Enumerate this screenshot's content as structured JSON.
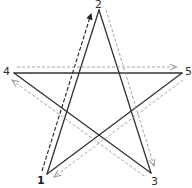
{
  "diagram": {
    "type": "pentagram-stroke-order",
    "vertices": [
      {
        "id": "1",
        "label": "1",
        "x": 47,
        "y": 174,
        "label_x": 37,
        "label_y": 175,
        "bold": true
      },
      {
        "id": "2",
        "label": "2",
        "x": 99,
        "y": 10,
        "label_x": 95,
        "label_y": -1,
        "bold": false
      },
      {
        "id": "3",
        "label": "3",
        "x": 151,
        "y": 173,
        "label_x": 151,
        "label_y": 176,
        "bold": false
      },
      {
        "id": "4",
        "label": "4",
        "x": 14,
        "y": 73,
        "label_x": 3,
        "label_y": 66,
        "bold": false
      },
      {
        "id": "5",
        "label": "5",
        "x": 182,
        "y": 73,
        "label_x": 185,
        "label_y": 66,
        "bold": false
      }
    ],
    "edges": [
      {
        "from": "1",
        "to": "2"
      },
      {
        "from": "2",
        "to": "3"
      },
      {
        "from": "3",
        "to": "4"
      },
      {
        "from": "4",
        "to": "5"
      },
      {
        "from": "5",
        "to": "1"
      }
    ],
    "arrows": [
      {
        "from": "1",
        "to": "2",
        "x1": 42,
        "y1": 171,
        "x2": 91,
        "y2": 14,
        "style": "dashed",
        "color": "#222222"
      },
      {
        "from": "2",
        "to": "3",
        "x1": 106,
        "y1": 10,
        "x2": 154,
        "y2": 166,
        "style": "dashed",
        "color": "#999999"
      },
      {
        "from": "3",
        "to": "4",
        "x1": 144,
        "y1": 176,
        "x2": 12,
        "y2": 80,
        "style": "dashed",
        "color": "#999999"
      },
      {
        "from": "4",
        "to": "5",
        "x1": 17,
        "y1": 67,
        "x2": 177,
        "y2": 67,
        "style": "dashed",
        "color": "#999999"
      },
      {
        "from": "5",
        "to": "1",
        "x1": 183,
        "y1": 80,
        "x2": 54,
        "y2": 177,
        "style": "dashed",
        "color": "#999999"
      }
    ],
    "colors": {
      "star_line": "#333333",
      "first_arrow": "#222222",
      "other_arrows": "#999999",
      "background": "#ffffff"
    }
  }
}
